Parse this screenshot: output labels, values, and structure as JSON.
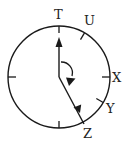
{
  "diagram": {
    "labels": {
      "t": "T",
      "u": "U",
      "x": "X",
      "y": "Y",
      "z": "Z"
    },
    "circle": {
      "cx": 59,
      "cy": 77,
      "r": 51
    },
    "colors": {
      "stroke": "#1a1a1a",
      "background": "#ffffff"
    },
    "rotation_direction": "clockwise"
  }
}
